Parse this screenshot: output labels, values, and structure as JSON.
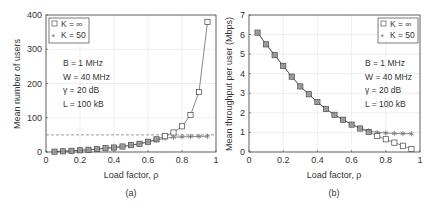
{
  "chart_data": [
    {
      "type": "line",
      "panel": "(a)",
      "title": "",
      "xlabel": "Load factor, ρ",
      "ylabel": "Mean number of users",
      "xlim": [
        0,
        1
      ],
      "ylim": [
        0,
        400
      ],
      "xticks": [
        "0",
        "0.2",
        "0.4",
        "0.6",
        "0.8",
        "1"
      ],
      "yticks": [
        "0",
        "100",
        "200",
        "300",
        "400"
      ],
      "grid": true,
      "legend_position": "upper left",
      "x": [
        0.05,
        0.1,
        0.15,
        0.2,
        0.25,
        0.3,
        0.35,
        0.4,
        0.45,
        0.5,
        0.55,
        0.6,
        0.65,
        0.7,
        0.75,
        0.8,
        0.85,
        0.9,
        0.95
      ],
      "series": [
        {
          "name": "K = ∞",
          "marker": "square",
          "values": [
            1,
            2,
            3.5,
            5,
            6.5,
            8.5,
            11,
            13,
            16,
            20,
            24,
            30,
            37,
            46,
            57,
            75,
            108,
            175,
            380
          ]
        },
        {
          "name": "K = 50",
          "marker": "asterisk",
          "values": [
            1,
            2,
            3.5,
            5,
            6.5,
            8.5,
            11,
            13,
            16,
            20,
            24,
            29,
            35,
            40,
            43,
            44.5,
            45,
            45.5,
            46
          ]
        }
      ],
      "reference_line": {
        "y": 50,
        "style": "dashed"
      },
      "annotations": [
        "B = 1 MHz",
        "W = 40 MHz",
        "γ = 20 dB",
        "L = 100 kB"
      ]
    },
    {
      "type": "line",
      "panel": "(b)",
      "title": "",
      "xlabel": "Load factor, ρ",
      "ylabel": "Mean throughput per user (Mbps)",
      "xlim": [
        0,
        1
      ],
      "ylim": [
        0,
        7
      ],
      "xticks": [
        "0",
        "0.2",
        "0.4",
        "0.6",
        "0.8",
        "1"
      ],
      "yticks": [
        "0",
        "1",
        "2",
        "3",
        "4",
        "5",
        "6",
        "7"
      ],
      "grid": true,
      "legend_position": "upper right",
      "x": [
        0.05,
        0.1,
        0.15,
        0.2,
        0.25,
        0.3,
        0.35,
        0.4,
        0.45,
        0.5,
        0.55,
        0.6,
        0.65,
        0.7,
        0.75,
        0.8,
        0.85,
        0.9,
        0.95
      ],
      "series": [
        {
          "name": "K = ∞",
          "marker": "square",
          "values": [
            6.1,
            5.5,
            4.95,
            4.4,
            3.85,
            3.35,
            2.95,
            2.55,
            2.2,
            1.9,
            1.65,
            1.4,
            1.2,
            1.02,
            0.82,
            0.65,
            0.48,
            0.32,
            0.16
          ]
        },
        {
          "name": "K = 50",
          "marker": "asterisk",
          "values": [
            6.1,
            5.5,
            4.95,
            4.4,
            3.85,
            3.35,
            2.95,
            2.55,
            2.2,
            1.9,
            1.65,
            1.42,
            1.22,
            1.08,
            1.0,
            0.97,
            0.95,
            0.94,
            0.93
          ]
        }
      ],
      "annotations": [
        "B = 1 MHz",
        "W = 40 MHz",
        "γ = 20 dB",
        "L = 100 kB"
      ]
    }
  ],
  "panels": {
    "a": {
      "caption": "(a)",
      "xlabel": "Load factor, ρ",
      "ylabel": "Mean number of users",
      "legend": [
        "K = ∞",
        "K = 50"
      ],
      "params": [
        "B = 1 MHz",
        "W = 40 MHz",
        "γ = 20 dB",
        "L = 100 kB"
      ],
      "xticks": [
        "0",
        "0.2",
        "0.4",
        "0.6",
        "0.8",
        "1"
      ],
      "yticks": [
        "0",
        "100",
        "200",
        "300",
        "400"
      ]
    },
    "b": {
      "caption": "(b)",
      "xlabel": "Load factor, ρ",
      "ylabel": "Mean throughput per user (Mbps)",
      "legend": [
        "K = ∞",
        "K = 50"
      ],
      "params": [
        "B = 1 MHz",
        "W = 40 MHz",
        "γ = 20 dB",
        "L = 100 kB"
      ],
      "xticks": [
        "0",
        "0.2",
        "0.4",
        "0.6",
        "0.8",
        "1"
      ],
      "yticks": [
        "0",
        "1",
        "2",
        "3",
        "4",
        "5",
        "6",
        "7"
      ]
    }
  },
  "colors": {
    "line": "#555555",
    "marker_fill": "#9a9a9a",
    "grid": "#e4e4e4",
    "axis": "#444444",
    "text": "#333333"
  }
}
